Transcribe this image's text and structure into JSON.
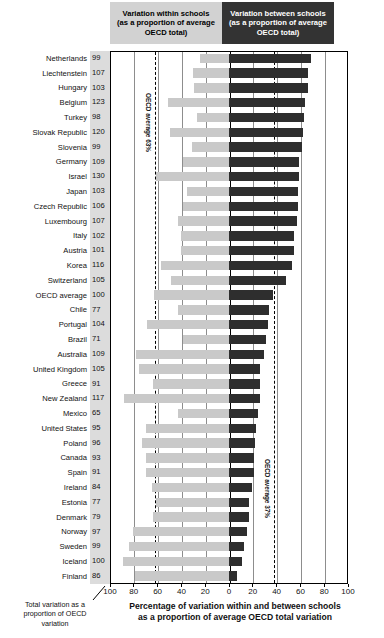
{
  "legend": {
    "within": [
      "Variation within schools",
      "(as a proportion of average",
      "OECD total)"
    ],
    "between": [
      "Variation between schools",
      "(as a proportion of average",
      "OECD total)"
    ]
  },
  "annotations": {
    "left_dashed_label": "OECD average 63%",
    "right_dashed_label": "OECD average 37%"
  },
  "captions": {
    "x_axis_line1": "Percentage of variation within and between schools",
    "x_axis_line2": "as a proportion of average OECD total variation",
    "left_line1": "Total variation as a",
    "left_line2": "proportion of OECD",
    "left_line3": "variation"
  },
  "chart_data": {
    "type": "bar",
    "orientation": "horizontal-diverging",
    "title": "Percentage of variation within and between schools as a proportion of average OECD total variation",
    "xlabel": "Percentage of variation within and between schools as a proportion of average OECD total variation",
    "ylabel": "",
    "xlim": [
      -100,
      100
    ],
    "xticks": [
      100,
      80,
      60,
      40,
      20,
      0,
      20,
      40,
      60,
      80,
      100
    ],
    "grid": true,
    "legend_position": "top",
    "reference_lines": [
      {
        "label": "OECD average 63%",
        "value": -63
      },
      {
        "label": "OECD average 37%",
        "value": 37
      }
    ],
    "value_column_header": "Total variation as a proportion of OECD variation",
    "series": [
      {
        "name": "Variation within schools (as a proportion of average OECD total)",
        "color": "#c9c9c9",
        "direction": "left"
      },
      {
        "name": "Variation between schools (as a proportion of average OECD total)",
        "color": "#2e2e2e",
        "direction": "right"
      }
    ],
    "categories": [
      "Netherlands",
      "Liechtenstein",
      "Hungary",
      "Belgium",
      "Turkey",
      "Slovak Republic",
      "Slovenia",
      "Germany",
      "Israel",
      "Japan",
      "Czech Republic",
      "Luxembourg",
      "Italy",
      "Austria",
      "Korea",
      "Switzerland",
      "OECD average",
      "Chile",
      "Portugal",
      "Brazil",
      "Australia",
      "United Kingdom",
      "Greece",
      "New Zealand",
      "Mexico",
      "United States",
      "Poland",
      "Canada",
      "Spain",
      "Ireland",
      "Estonia",
      "Denmark",
      "Norway",
      "Sweden",
      "Iceland",
      "Finland"
    ],
    "total_variation": [
      99,
      107,
      103,
      123,
      98,
      120,
      99,
      109,
      130,
      103,
      106,
      107,
      102,
      101,
      116,
      105,
      100,
      77,
      104,
      71,
      109,
      105,
      91,
      117,
      65,
      95,
      96,
      93,
      91,
      84,
      77,
      79,
      97,
      99,
      100,
      86
    ],
    "within_schools": [
      24,
      30,
      29,
      51,
      27,
      50,
      31,
      39,
      61,
      35,
      39,
      43,
      40,
      40,
      57,
      49,
      63,
      43,
      69,
      39,
      78,
      76,
      64,
      88,
      43,
      70,
      73,
      70,
      70,
      65,
      61,
      64,
      81,
      84,
      89,
      79
    ],
    "between_schools": [
      69,
      66,
      66,
      64,
      63,
      62,
      61,
      59,
      59,
      58,
      58,
      57,
      55,
      55,
      53,
      48,
      37,
      34,
      33,
      31,
      29,
      26,
      26,
      26,
      24,
      23,
      22,
      21,
      21,
      19,
      17,
      17,
      15,
      13,
      11,
      7
    ],
    "rows": [
      {
        "country": "Netherlands",
        "total": 99,
        "within": 24,
        "between": 69
      },
      {
        "country": "Liechtenstein",
        "total": 107,
        "within": 30,
        "between": 66
      },
      {
        "country": "Hungary",
        "total": 103,
        "within": 29,
        "between": 66
      },
      {
        "country": "Belgium",
        "total": 123,
        "within": 51,
        "between": 64
      },
      {
        "country": "Turkey",
        "total": 98,
        "within": 27,
        "between": 63
      },
      {
        "country": "Slovak Republic",
        "total": 120,
        "within": 50,
        "between": 62
      },
      {
        "country": "Slovenia",
        "total": 99,
        "within": 31,
        "between": 61
      },
      {
        "country": "Germany",
        "total": 109,
        "within": 39,
        "between": 59
      },
      {
        "country": "Israel",
        "total": 130,
        "within": 61,
        "between": 59
      },
      {
        "country": "Japan",
        "total": 103,
        "within": 35,
        "between": 58
      },
      {
        "country": "Czech Republic",
        "total": 106,
        "within": 39,
        "between": 58
      },
      {
        "country": "Luxembourg",
        "total": 107,
        "within": 43,
        "between": 57
      },
      {
        "country": "Italy",
        "total": 102,
        "within": 40,
        "between": 55
      },
      {
        "country": "Austria",
        "total": 101,
        "within": 40,
        "between": 55
      },
      {
        "country": "Korea",
        "total": 116,
        "within": 57,
        "between": 53
      },
      {
        "country": "Switzerland",
        "total": 105,
        "within": 49,
        "between": 48
      },
      {
        "country": "OECD average",
        "total": 100,
        "within": 63,
        "between": 37
      },
      {
        "country": "Chile",
        "total": 77,
        "within": 43,
        "between": 34
      },
      {
        "country": "Portugal",
        "total": 104,
        "within": 69,
        "between": 33
      },
      {
        "country": "Brazil",
        "total": 71,
        "within": 39,
        "between": 31
      },
      {
        "country": "Australia",
        "total": 109,
        "within": 78,
        "between": 29
      },
      {
        "country": "United Kingdom",
        "total": 105,
        "within": 76,
        "between": 26
      },
      {
        "country": "Greece",
        "total": 91,
        "within": 64,
        "between": 26
      },
      {
        "country": "New Zealand",
        "total": 117,
        "within": 88,
        "between": 26
      },
      {
        "country": "Mexico",
        "total": 65,
        "within": 43,
        "between": 24
      },
      {
        "country": "United States",
        "total": 95,
        "within": 70,
        "between": 23
      },
      {
        "country": "Poland",
        "total": 96,
        "within": 73,
        "between": 22
      },
      {
        "country": "Canada",
        "total": 93,
        "within": 70,
        "between": 21
      },
      {
        "country": "Spain",
        "total": 91,
        "within": 70,
        "between": 21
      },
      {
        "country": "Ireland",
        "total": 84,
        "within": 65,
        "between": 19
      },
      {
        "country": "Estonia",
        "total": 77,
        "within": 61,
        "between": 17
      },
      {
        "country": "Denmark",
        "total": 79,
        "within": 64,
        "between": 17
      },
      {
        "country": "Norway",
        "total": 97,
        "within": 81,
        "between": 15
      },
      {
        "country": "Sweden",
        "total": 99,
        "within": 84,
        "between": 13
      },
      {
        "country": "Iceland",
        "total": 100,
        "within": 89,
        "between": 11
      },
      {
        "country": "Finland",
        "total": 86,
        "within": 79,
        "between": 7
      }
    ]
  }
}
